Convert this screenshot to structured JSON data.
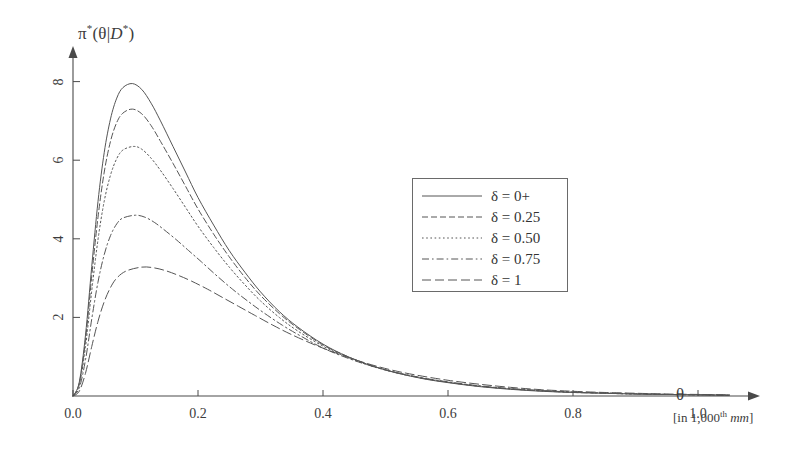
{
  "chart_data": {
    "type": "line",
    "title": "",
    "ylabel": "π*(θ|D*)",
    "xlabel": "θ",
    "xlabel_units": "[in 1,000th mm]",
    "xlim": [
      0.0,
      1.08
    ],
    "ylim": [
      0,
      8.6
    ],
    "xticks": [
      0.0,
      0.2,
      0.4,
      0.6,
      0.8,
      1.0
    ],
    "xtick_labels": [
      "0.0",
      "0.2",
      "0.4",
      "0.6",
      "0.8",
      "1.0"
    ],
    "yticks": [
      2,
      4,
      6,
      8
    ],
    "ytick_labels": [
      "2",
      "4",
      "6",
      "8"
    ],
    "grid": false,
    "legend_position": "center-right",
    "series": [
      {
        "name": "δ = 0+",
        "dash": "solid",
        "peak_x": 0.095,
        "peak_y": 7.95,
        "points": [
          [
            0.0,
            0.0
          ],
          [
            0.01,
            0.35
          ],
          [
            0.02,
            1.55
          ],
          [
            0.03,
            3.3
          ],
          [
            0.04,
            4.95
          ],
          [
            0.05,
            6.2
          ],
          [
            0.06,
            7.05
          ],
          [
            0.07,
            7.58
          ],
          [
            0.08,
            7.85
          ],
          [
            0.095,
            7.95
          ],
          [
            0.11,
            7.8
          ],
          [
            0.125,
            7.45
          ],
          [
            0.14,
            7.0
          ],
          [
            0.16,
            6.35
          ],
          [
            0.18,
            5.7
          ],
          [
            0.2,
            5.05
          ],
          [
            0.225,
            4.35
          ],
          [
            0.25,
            3.7
          ],
          [
            0.275,
            3.15
          ],
          [
            0.3,
            2.65
          ],
          [
            0.33,
            2.15
          ],
          [
            0.36,
            1.75
          ],
          [
            0.4,
            1.32
          ],
          [
            0.44,
            1.0
          ],
          [
            0.48,
            0.76
          ],
          [
            0.52,
            0.58
          ],
          [
            0.56,
            0.44
          ],
          [
            0.6,
            0.34
          ],
          [
            0.65,
            0.24
          ],
          [
            0.7,
            0.17
          ],
          [
            0.75,
            0.12
          ],
          [
            0.8,
            0.09
          ],
          [
            0.85,
            0.07
          ],
          [
            0.9,
            0.05
          ],
          [
            0.95,
            0.04
          ],
          [
            1.0,
            0.03
          ],
          [
            1.05,
            0.02
          ]
        ]
      },
      {
        "name": "δ = 0.25",
        "dash": "dashed",
        "peak_x": 0.095,
        "peak_y": 7.3,
        "points": [
          [
            0.0,
            0.0
          ],
          [
            0.01,
            0.32
          ],
          [
            0.02,
            1.42
          ],
          [
            0.03,
            3.05
          ],
          [
            0.04,
            4.55
          ],
          [
            0.05,
            5.7
          ],
          [
            0.06,
            6.48
          ],
          [
            0.07,
            6.96
          ],
          [
            0.08,
            7.2
          ],
          [
            0.095,
            7.3
          ],
          [
            0.11,
            7.18
          ],
          [
            0.125,
            6.88
          ],
          [
            0.14,
            6.48
          ],
          [
            0.16,
            5.92
          ],
          [
            0.18,
            5.34
          ],
          [
            0.2,
            4.76
          ],
          [
            0.225,
            4.12
          ],
          [
            0.25,
            3.54
          ],
          [
            0.275,
            3.02
          ],
          [
            0.3,
            2.56
          ],
          [
            0.33,
            2.1
          ],
          [
            0.36,
            1.72
          ],
          [
            0.4,
            1.3
          ],
          [
            0.44,
            1.0
          ],
          [
            0.48,
            0.76
          ],
          [
            0.52,
            0.58
          ],
          [
            0.56,
            0.45
          ],
          [
            0.6,
            0.35
          ],
          [
            0.65,
            0.25
          ],
          [
            0.7,
            0.18
          ],
          [
            0.75,
            0.13
          ],
          [
            0.8,
            0.09
          ],
          [
            0.85,
            0.07
          ],
          [
            0.9,
            0.05
          ],
          [
            0.95,
            0.04
          ],
          [
            1.0,
            0.03
          ],
          [
            1.05,
            0.02
          ]
        ]
      },
      {
        "name": "δ = 0.50",
        "dash": "dotted",
        "peak_x": 0.097,
        "peak_y": 6.35,
        "points": [
          [
            0.0,
            0.0
          ],
          [
            0.01,
            0.28
          ],
          [
            0.02,
            1.25
          ],
          [
            0.03,
            2.68
          ],
          [
            0.04,
            3.98
          ],
          [
            0.05,
            4.96
          ],
          [
            0.06,
            5.62
          ],
          [
            0.07,
            6.04
          ],
          [
            0.08,
            6.26
          ],
          [
            0.097,
            6.35
          ],
          [
            0.11,
            6.28
          ],
          [
            0.125,
            6.05
          ],
          [
            0.14,
            5.74
          ],
          [
            0.16,
            5.28
          ],
          [
            0.18,
            4.8
          ],
          [
            0.2,
            4.32
          ],
          [
            0.225,
            3.78
          ],
          [
            0.25,
            3.28
          ],
          [
            0.275,
            2.83
          ],
          [
            0.3,
            2.42
          ],
          [
            0.33,
            2.0
          ],
          [
            0.36,
            1.65
          ],
          [
            0.4,
            1.27
          ],
          [
            0.44,
            0.98
          ],
          [
            0.48,
            0.75
          ],
          [
            0.52,
            0.58
          ],
          [
            0.56,
            0.45
          ],
          [
            0.6,
            0.35
          ],
          [
            0.65,
            0.25
          ],
          [
            0.7,
            0.18
          ],
          [
            0.75,
            0.13
          ],
          [
            0.8,
            0.1
          ],
          [
            0.85,
            0.07
          ],
          [
            0.9,
            0.05
          ],
          [
            0.95,
            0.04
          ],
          [
            1.0,
            0.03
          ],
          [
            1.05,
            0.02
          ]
        ]
      },
      {
        "name": "δ = 0.75",
        "dash": "dashdot",
        "peak_x": 0.1,
        "peak_y": 4.6,
        "points": [
          [
            0.0,
            0.0
          ],
          [
            0.01,
            0.2
          ],
          [
            0.02,
            0.92
          ],
          [
            0.03,
            1.96
          ],
          [
            0.04,
            2.9
          ],
          [
            0.05,
            3.6
          ],
          [
            0.06,
            4.08
          ],
          [
            0.07,
            4.38
          ],
          [
            0.08,
            4.53
          ],
          [
            0.1,
            4.6
          ],
          [
            0.115,
            4.55
          ],
          [
            0.13,
            4.42
          ],
          [
            0.145,
            4.24
          ],
          [
            0.165,
            3.98
          ],
          [
            0.185,
            3.7
          ],
          [
            0.205,
            3.42
          ],
          [
            0.23,
            3.06
          ],
          [
            0.255,
            2.72
          ],
          [
            0.28,
            2.41
          ],
          [
            0.305,
            2.12
          ],
          [
            0.335,
            1.8
          ],
          [
            0.365,
            1.52
          ],
          [
            0.4,
            1.22
          ],
          [
            0.44,
            0.96
          ],
          [
            0.48,
            0.75
          ],
          [
            0.52,
            0.59
          ],
          [
            0.56,
            0.46
          ],
          [
            0.6,
            0.36
          ],
          [
            0.65,
            0.26
          ],
          [
            0.7,
            0.19
          ],
          [
            0.75,
            0.14
          ],
          [
            0.8,
            0.1
          ],
          [
            0.85,
            0.08
          ],
          [
            0.9,
            0.06
          ],
          [
            0.95,
            0.04
          ],
          [
            1.0,
            0.03
          ],
          [
            1.05,
            0.02
          ]
        ]
      },
      {
        "name": "δ = 1",
        "dash": "longdash",
        "peak_x": 0.11,
        "peak_y": 3.28,
        "points": [
          [
            0.0,
            0.0
          ],
          [
            0.01,
            0.12
          ],
          [
            0.02,
            0.58
          ],
          [
            0.03,
            1.26
          ],
          [
            0.04,
            1.9
          ],
          [
            0.05,
            2.4
          ],
          [
            0.06,
            2.76
          ],
          [
            0.07,
            3.0
          ],
          [
            0.085,
            3.18
          ],
          [
            0.11,
            3.28
          ],
          [
            0.13,
            3.26
          ],
          [
            0.15,
            3.18
          ],
          [
            0.17,
            3.06
          ],
          [
            0.19,
            2.92
          ],
          [
            0.215,
            2.72
          ],
          [
            0.24,
            2.5
          ],
          [
            0.265,
            2.28
          ],
          [
            0.29,
            2.06
          ],
          [
            0.32,
            1.8
          ],
          [
            0.35,
            1.56
          ],
          [
            0.39,
            1.28
          ],
          [
            0.43,
            1.04
          ],
          [
            0.47,
            0.83
          ],
          [
            0.51,
            0.66
          ],
          [
            0.55,
            0.53
          ],
          [
            0.6,
            0.4
          ],
          [
            0.65,
            0.3
          ],
          [
            0.7,
            0.22
          ],
          [
            0.75,
            0.16
          ],
          [
            0.8,
            0.12
          ],
          [
            0.85,
            0.09
          ],
          [
            0.9,
            0.07
          ],
          [
            0.95,
            0.05
          ],
          [
            1.0,
            0.04
          ],
          [
            1.05,
            0.03
          ]
        ]
      }
    ]
  },
  "axes": {
    "y_axis_label": "π*(θ|D*)",
    "x_axis_label": "θ",
    "x_axis_units": "[in 1,000th mm]"
  },
  "legend": {
    "items": [
      {
        "label": "δ = 0+",
        "dash": "solid"
      },
      {
        "label": "δ = 0.25",
        "dash": "dashed"
      },
      {
        "label": "δ = 0.50",
        "dash": "dotted"
      },
      {
        "label": "δ = 0.75",
        "dash": "dashdot"
      },
      {
        "label": "δ = 1",
        "dash": "longdash"
      }
    ]
  },
  "colors": {
    "line": "#555555",
    "axis": "#4a4a4a",
    "text": "#3c3c3c",
    "background": "#ffffff"
  }
}
